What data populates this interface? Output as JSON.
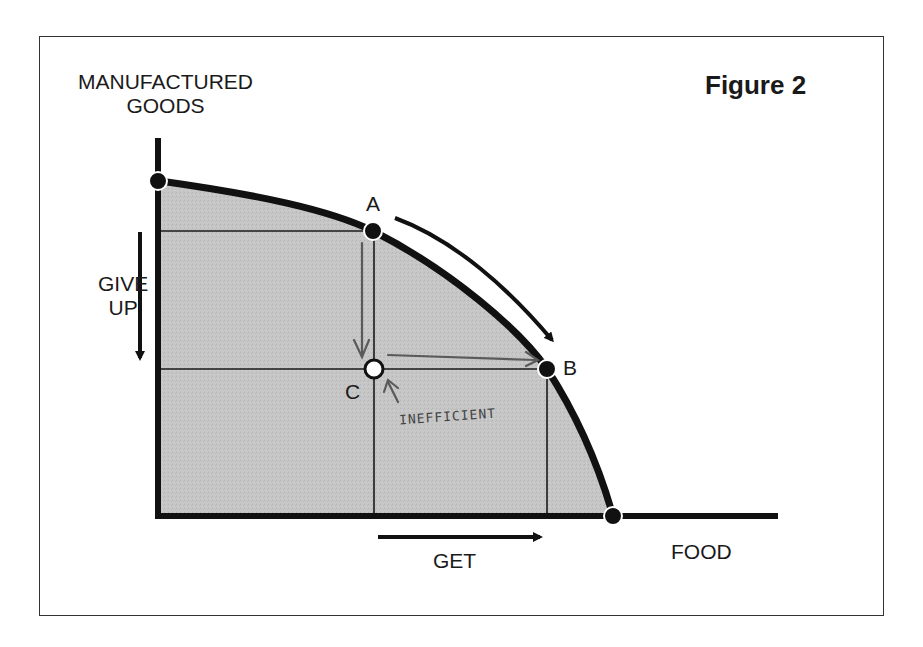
{
  "figure": {
    "title": "Figure 2",
    "y_axis_label_line1": "MANUFACTURED",
    "y_axis_label_line2": "GOODS",
    "x_axis_label": "FOOD",
    "give_up_line1": "GIVE",
    "give_up_line2": "UP",
    "get_label": "GET",
    "points": {
      "a": "A",
      "b": "B",
      "c": "C"
    },
    "annotation": "INEFFICIENT",
    "colors": {
      "curve": "#111111",
      "fill": "#c4c4c4",
      "hand_arrow": "#5a5a5a",
      "frame": "#333333"
    }
  }
}
